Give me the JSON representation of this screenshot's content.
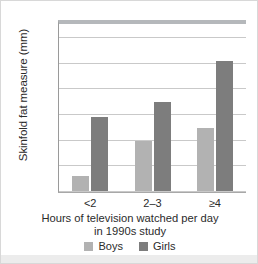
{
  "chart_data": {
    "type": "bar",
    "title": "",
    "categories": [
      "<2",
      "2–3",
      "≥4"
    ],
    "series": [
      {
        "name": "Boys",
        "color": "#b2b2b2",
        "values": [
          21.2,
          23.9,
          24.9
        ]
      },
      {
        "name": "Girls",
        "color": "#7d7d7d",
        "values": [
          25.8,
          26.9,
          30.1
        ]
      }
    ],
    "xlabel": "Hours of television watched per day in 1990s study",
    "ylabel": "Skinfold fat measure (mm)",
    "ylim": [
      20,
      33
    ],
    "yticks": [
      20,
      22,
      24,
      26,
      28,
      30,
      32
    ],
    "grid": true,
    "legend_position": "bottom"
  },
  "axes": {
    "y_title": "Skinfold fat measure (mm)",
    "x_title_line1": "Hours of television watched per day",
    "x_title_line2": "in 1990s study",
    "y_tick_labels": [
      "20",
      "22",
      "24",
      "26",
      "28",
      "30",
      "32"
    ],
    "x_tick_labels": [
      "<2",
      "2–3",
      "≥4"
    ]
  },
  "legend": {
    "entries": [
      {
        "label": "Boys",
        "color": "#b2b2b2"
      },
      {
        "label": "Girls",
        "color": "#7d7d7d"
      }
    ]
  }
}
